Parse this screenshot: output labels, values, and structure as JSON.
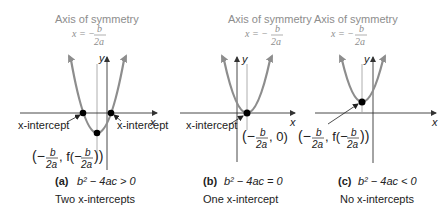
{
  "panels": [
    {
      "id": "a",
      "axis_title": "Axis of symmetry",
      "axis_eq_lhs": "x = −",
      "axis_eq_num": "b",
      "axis_eq_den": "2a",
      "y_label": "y",
      "x_label": "x",
      "intercept_left_label": "x-intercept",
      "intercept_right_label": "x-intercept",
      "vertex_open": "(−",
      "vertex_num": "b",
      "vertex_den": "2a",
      "vertex_mid": ", f(−",
      "vertex_num2": "b",
      "vertex_den2": "2a",
      "vertex_close": "))",
      "caption_label": "(a)",
      "caption_eq": "b² − 4ac > 0",
      "caption_sub": "Two x-intercepts"
    },
    {
      "id": "b",
      "axis_title": "Axis of symmetry",
      "axis_eq_lhs": "x = −",
      "axis_eq_num": "b",
      "axis_eq_den": "2a",
      "y_label": "y",
      "x_label": "x",
      "intercept_label": "x-intercept",
      "vertex_open": "(−",
      "vertex_num": "b",
      "vertex_den": "2a",
      "vertex_close": ", 0)",
      "caption_label": "(b)",
      "caption_eq": "b² − 4ac = 0",
      "caption_sub": "One x-intercept"
    },
    {
      "id": "c",
      "axis_title": "Axis of symmetry",
      "axis_eq_lhs": "x = −",
      "axis_eq_num": "b",
      "axis_eq_den": "2a",
      "y_label": "y",
      "x_label": "x",
      "vertex_open": "(−",
      "vertex_num": "b",
      "vertex_den": "2a",
      "vertex_mid": ", f(−",
      "vertex_num2": "b",
      "vertex_den2": "2a",
      "vertex_close": "))",
      "caption_label": "(c)",
      "caption_eq": "b² − 4ac < 0",
      "caption_sub": "No x-intercepts"
    }
  ],
  "colors": {
    "parabola": "#8d8d8d",
    "axis": "#333333",
    "symmetry_line": "#999999",
    "point": "#000000",
    "symmetry_text": "#8d8d8d"
  }
}
